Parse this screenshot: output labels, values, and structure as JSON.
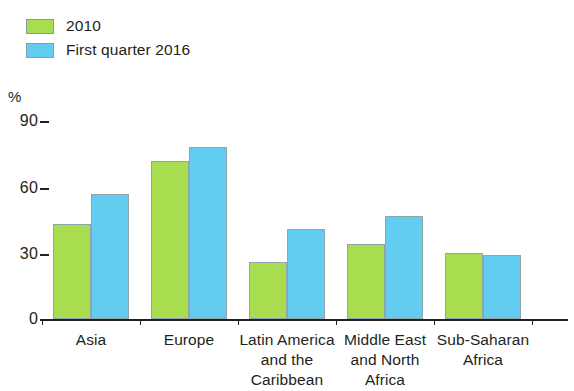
{
  "legend": {
    "items": [
      {
        "label": "2010",
        "color": "#a8dd4f"
      },
      {
        "label": "First quarter 2016",
        "color": "#63cdf1"
      }
    ]
  },
  "axis": {
    "unit": "%",
    "yticks": [
      "90",
      "60",
      "30",
      "0"
    ]
  },
  "chart_data": {
    "type": "bar",
    "title": "",
    "subtitle": "",
    "xlabel": "",
    "ylabel": "%",
    "ylim": [
      0,
      90
    ],
    "yticks": [
      0,
      30,
      60,
      90
    ],
    "grid": false,
    "legend_position": "top-left",
    "categories": [
      "Asia",
      "Europe",
      "Latin America and the Caribbean",
      "Middle East and North Africa",
      "Sub-Saharan Africa"
    ],
    "category_lines": [
      [
        "Asia"
      ],
      [
        "Europe"
      ],
      [
        "Latin America",
        "and the",
        "Caribbean"
      ],
      [
        "Middle East",
        "and North",
        "Africa"
      ],
      [
        "Sub-Saharan",
        "Africa"
      ]
    ],
    "series": [
      {
        "name": "2010",
        "color": "#a8dd4f",
        "values": [
          43,
          72,
          26,
          34,
          30
        ]
      },
      {
        "name": "First quarter 2016",
        "color": "#63cdf1",
        "values": [
          57,
          78,
          41,
          47,
          29
        ]
      }
    ]
  }
}
